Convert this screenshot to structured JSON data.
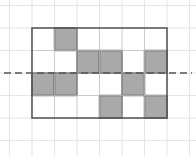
{
  "figure": {
    "grid": {
      "columns": 6,
      "rows": 4,
      "cell_size_px": 22.5,
      "origin_x_px": 32,
      "origin_y_px": 28
    },
    "shaded_cells": [
      {
        "row": 0,
        "col": 1
      },
      {
        "row": 1,
        "col": 2
      },
      {
        "row": 1,
        "col": 3
      },
      {
        "row": 1,
        "col": 5
      },
      {
        "row": 2,
        "col": 0
      },
      {
        "row": 2,
        "col": 1
      },
      {
        "row": 2,
        "col": 4
      },
      {
        "row": 3,
        "col": 3
      },
      {
        "row": 3,
        "col": 5
      }
    ],
    "shaded_count": 9,
    "symmetry_line": {
      "orientation": "horizontal",
      "at_row_boundary": 2,
      "style": "dashed",
      "extends_beyond_figure": true
    },
    "colors": {
      "shaded_fill": "#a9a9a9",
      "shaded_stroke": "#4d4d4d",
      "figure_outline": "#595959",
      "inner_grid_line": "#b5b5b5",
      "background_grid": "#e4e4ea",
      "dashed_line": "#555555",
      "page_background": "#ffffff"
    }
  }
}
